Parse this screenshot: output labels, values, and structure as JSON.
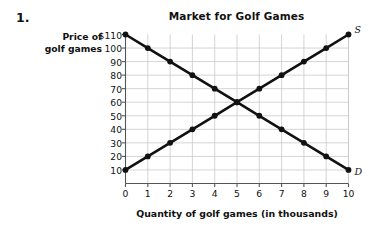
{
  "problem": {
    "number": "1."
  },
  "chart_data": {
    "type": "line",
    "title": "Market for Golf Games",
    "xlabel": "Quantity of golf games (in thousands)",
    "ylabel": "Price of golf games",
    "ylabel_line1": "Price of",
    "ylabel_line2": "golf games",
    "xlim": [
      0,
      10
    ],
    "ylim": [
      0,
      110
    ],
    "grid": true,
    "legend": "inline-curve-labels",
    "x_ticks": [
      "0",
      "1",
      "2",
      "3",
      "4",
      "5",
      "6",
      "7",
      "8",
      "9",
      "10"
    ],
    "x_tick_values": [
      0,
      1,
      2,
      3,
      4,
      5,
      6,
      7,
      8,
      9,
      10
    ],
    "y_ticks": [
      "$110",
      "100",
      "90",
      "80",
      "70",
      "60",
      "50",
      "40",
      "30",
      "20",
      "10"
    ],
    "y_tick_values": [
      110,
      100,
      90,
      80,
      70,
      60,
      50,
      40,
      30,
      20,
      10
    ],
    "x": [
      0,
      1,
      2,
      3,
      4,
      5,
      6,
      7,
      8,
      9,
      10
    ],
    "series": [
      {
        "name": "Demand",
        "label": "D",
        "label_position": "right-bottom",
        "color": "#111111",
        "values": [
          110,
          100,
          90,
          80,
          70,
          60,
          50,
          40,
          30,
          20,
          10
        ]
      },
      {
        "name": "Supply",
        "label": "S",
        "label_position": "right-top",
        "color": "#111111",
        "values": [
          10,
          20,
          30,
          40,
          50,
          60,
          70,
          80,
          90,
          100,
          110
        ]
      }
    ],
    "annotations": [
      {
        "name": "equilibrium",
        "x": 5,
        "y": 60
      }
    ]
  }
}
